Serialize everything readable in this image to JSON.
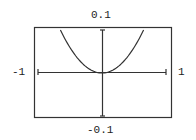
{
  "chart_data": {
    "type": "line",
    "title": "",
    "xlabel": "",
    "ylabel": "",
    "xlim": [
      -1,
      1
    ],
    "ylim": [
      -0.1,
      0.1
    ],
    "tick_labels": {
      "top": "0.1",
      "bottom": "-0.1",
      "left": "-1",
      "right": "1"
    },
    "grid": false,
    "series": [
      {
        "name": "y = 0.24x^2",
        "x": [
          -0.65,
          -0.5,
          -0.25,
          0,
          0.25,
          0.5,
          0.65
        ],
        "y": [
          0.1,
          0.06,
          0.015,
          0,
          0.015,
          0.06,
          0.1
        ]
      }
    ]
  },
  "labels": {
    "top": "0.1",
    "bottom": "-0.1",
    "left": "-1",
    "right": "1"
  }
}
